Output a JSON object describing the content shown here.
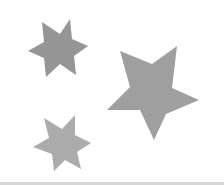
{
  "scene": {
    "background": "#ffffff",
    "shapes": [
      {
        "name": "six-point-star-top-left",
        "type": "six-point-star",
        "color": "#9a9a9a",
        "points": "42,22 60,34 70,19 72,39 88,46 74,56 76,75 60,64 46,77 44,58 28,51 44,42"
      },
      {
        "name": "five-point-star-large",
        "type": "five-point-star",
        "color": "#a4a4a4",
        "points": "120,51 152,64 177,46 172,88 199,100 166,114 154,140 140,110 107,110 130,87"
      },
      {
        "name": "six-point-star-bottom-left",
        "type": "six-point-star",
        "color": "#b0b0b0",
        "points": "44,118 62,129 75,115 75,135 91,143 77,152 81,169 65,160 54,171 52,154 33,147 49,138"
      }
    ],
    "bottom_strip_color": "#d6d6d6"
  }
}
